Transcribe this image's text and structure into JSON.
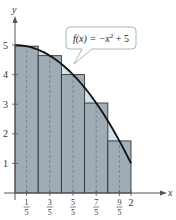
{
  "chart_data": {
    "type": "bar",
    "title": "",
    "xlabel": "x",
    "ylabel": "y",
    "xlim": [
      0,
      2
    ],
    "ylim": [
      0,
      5
    ],
    "function_label": "f(x) = −x² + 5",
    "function_label_parts": {
      "lhs": "f(x) = −x",
      "exp": "2",
      "rhs": " + 5"
    },
    "method": "midpoint rectangles, n = 5",
    "categories": [
      "1/5",
      "3/5",
      "5/5",
      "7/5",
      "9/5"
    ],
    "midpoints": [
      0.2,
      0.6,
      1.0,
      1.4,
      1.8
    ],
    "bin_edges": [
      0,
      0.4,
      0.8,
      1.2,
      1.6,
      2.0
    ],
    "values": [
      4.96,
      4.64,
      4.0,
      3.04,
      1.76
    ],
    "y_ticks": [
      "1",
      "2",
      "3",
      "4",
      "5"
    ],
    "x_tick_fractions": [
      {
        "num": "1",
        "den": "5"
      },
      {
        "num": "3",
        "den": "5"
      },
      {
        "num": "5",
        "den": "5"
      },
      {
        "num": "7",
        "den": "5"
      },
      {
        "num": "9",
        "den": "5"
      }
    ],
    "x_end_tick": "2",
    "grid": false,
    "colors": {
      "rect_fill": "#9ba7b1",
      "gap_fill": "#cde4ec",
      "curve": "#111111",
      "midline": "#5f7d98"
    }
  }
}
